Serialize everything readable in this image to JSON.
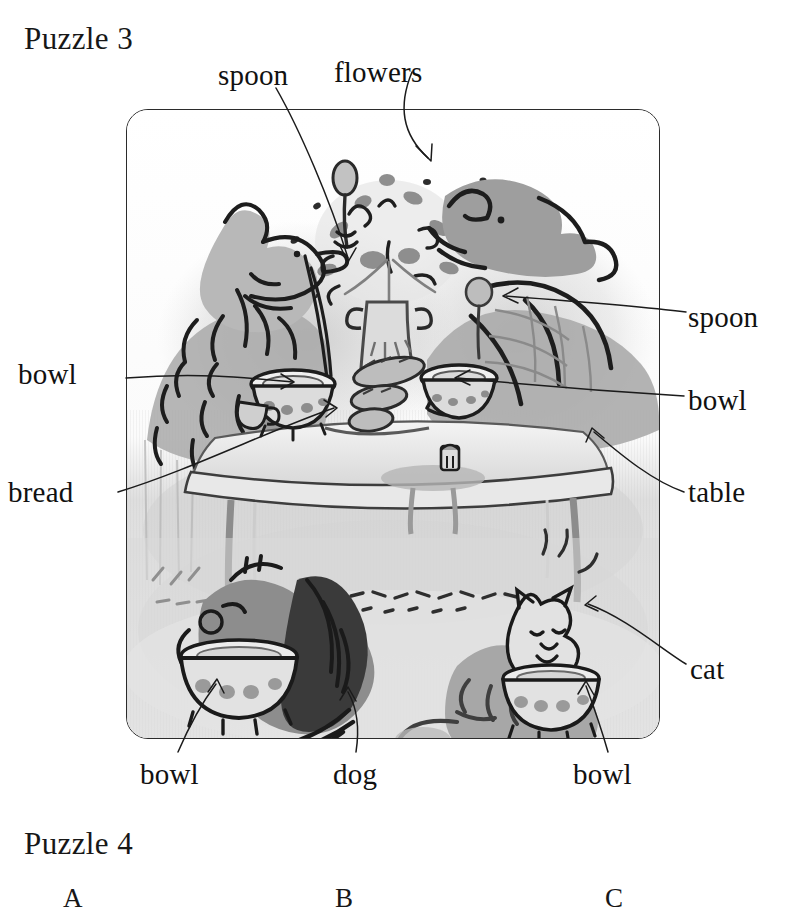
{
  "page": {
    "background_color": "#ffffff",
    "ink_color": "#1b1b1b",
    "width": 794,
    "height": 913
  },
  "puzzle3": {
    "heading": "Puzzle 3",
    "frame": {
      "x": 126,
      "y": 109,
      "width": 532,
      "height": 628,
      "corner_radius": 22,
      "border_color": "#2b2b2b"
    },
    "scene_description": "Grey-wash ink illustration: two animal characters seated at a table with bowls, spoons, bread and a vase of flowers; below the table a dog and a cat each eat from a bowl.",
    "labels": [
      {
        "id": "spoon-top",
        "text": "spoon",
        "x": 218,
        "y": 61,
        "anchor": "left"
      },
      {
        "id": "flowers",
        "text": "flowers",
        "x": 334,
        "y": 58,
        "anchor": "left"
      },
      {
        "id": "spoon-right",
        "text": "spoon",
        "x": 688,
        "y": 303,
        "anchor": "left"
      },
      {
        "id": "bowl-left",
        "text": "bowl",
        "x": 18,
        "y": 360,
        "anchor": "left"
      },
      {
        "id": "bowl-right",
        "text": "bowl",
        "x": 688,
        "y": 386,
        "anchor": "left"
      },
      {
        "id": "bread",
        "text": "bread",
        "x": 8,
        "y": 478,
        "anchor": "left"
      },
      {
        "id": "table",
        "text": "table",
        "x": 688,
        "y": 478,
        "anchor": "left"
      },
      {
        "id": "cat",
        "text": "cat",
        "x": 690,
        "y": 655,
        "anchor": "left"
      },
      {
        "id": "bowl-bottom-left",
        "text": "bowl",
        "x": 140,
        "y": 760,
        "anchor": "left"
      },
      {
        "id": "dog",
        "text": "dog",
        "x": 333,
        "y": 760,
        "anchor": "left"
      },
      {
        "id": "bowl-bottom-right",
        "text": "bowl",
        "x": 573,
        "y": 760,
        "anchor": "left"
      }
    ]
  },
  "puzzle4": {
    "heading": "Puzzle 4",
    "answer_letters": [
      {
        "label": "A",
        "x": 63
      },
      {
        "label": "B",
        "x": 335
      },
      {
        "label": "C",
        "x": 605
      }
    ]
  }
}
